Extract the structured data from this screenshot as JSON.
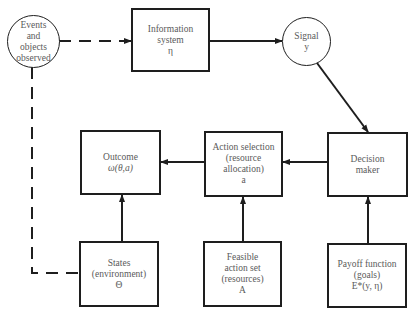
{
  "diagram": {
    "nodes": {
      "events": {
        "lines": [
          "Events",
          "and",
          "objects",
          "observed"
        ]
      },
      "info_system": {
        "lines": [
          "Information",
          "system",
          "η"
        ]
      },
      "signal": {
        "lines": [
          "Signal",
          "y"
        ]
      },
      "decision_maker": {
        "lines": [
          "Decision",
          "maker"
        ]
      },
      "action_selection": {
        "lines": [
          "Action selection",
          "(resource",
          "allocation)",
          "a"
        ]
      },
      "outcome": {
        "lines": [
          "Outcome",
          "ω(θ,a)"
        ]
      },
      "states": {
        "lines": [
          "States",
          "(environment)",
          "Θ"
        ]
      },
      "feasible": {
        "lines": [
          "Feasible",
          "action set",
          "(resources)",
          "A"
        ]
      },
      "payoff": {
        "lines": [
          "Payoff function",
          "(goals)",
          "E*(y, η)"
        ]
      }
    },
    "edges": [
      {
        "from": "events",
        "to": "info_system",
        "style": "dashed"
      },
      {
        "from": "info_system",
        "to": "signal",
        "style": "solid"
      },
      {
        "from": "signal",
        "to": "decision_maker",
        "style": "solid"
      },
      {
        "from": "decision_maker",
        "to": "action_selection",
        "style": "solid"
      },
      {
        "from": "action_selection",
        "to": "outcome",
        "style": "solid"
      },
      {
        "from": "states",
        "to": "outcome",
        "style": "solid"
      },
      {
        "from": "feasible",
        "to": "action_selection",
        "style": "solid"
      },
      {
        "from": "payoff",
        "to": "decision_maker",
        "style": "solid"
      },
      {
        "from": "events",
        "to": "states",
        "style": "dashed"
      }
    ]
  }
}
